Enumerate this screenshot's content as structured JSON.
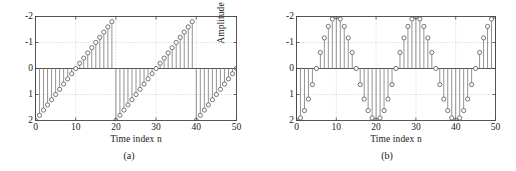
{
  "figure": {
    "panels": [
      {
        "caption": "(a)",
        "xlabel": "Time index n",
        "ylabel": "Amplitude",
        "xticks": [
          "0",
          "10",
          "20",
          "30",
          "40",
          "50"
        ],
        "yticks": [
          "2",
          "1",
          "0",
          "-1",
          "-2"
        ],
        "marker_color": "#555555",
        "stem_color": "#777777",
        "axis_color": "#444444",
        "grid_color": "#b0b0b0"
      },
      {
        "caption": "(b)",
        "xlabel": "Time index n",
        "ylabel": "Amplitude",
        "xticks": [
          "0",
          "10",
          "20",
          "30",
          "40",
          "50"
        ],
        "yticks": [
          "2",
          "1",
          "0",
          "-1",
          "-2"
        ],
        "marker_color": "#555555",
        "stem_color": "#777777",
        "axis_color": "#444444",
        "grid_color": "#b0b0b0"
      }
    ]
  },
  "chart_data": [
    {
      "type": "line",
      "title": "(a)",
      "subtitle": "",
      "plot_style": "stem",
      "xlabel": "Time index n",
      "ylabel": "Amplitude",
      "xlim": [
        0,
        50
      ],
      "ylim": [
        -2,
        2
      ],
      "xticks": [
        0,
        10,
        20,
        30,
        40,
        50
      ],
      "yticks": [
        -2,
        -1,
        0,
        1,
        2
      ],
      "grid": true,
      "legend": null,
      "description": "Sawtooth sequence of period 20, ramping from -2 up to 1.8 in steps of 0.2",
      "x": [
        0,
        1,
        2,
        3,
        4,
        5,
        6,
        7,
        8,
        9,
        10,
        11,
        12,
        13,
        14,
        15,
        16,
        17,
        18,
        19,
        20,
        21,
        22,
        23,
        24,
        25,
        26,
        27,
        28,
        29,
        30,
        31,
        32,
        33,
        34,
        35,
        36,
        37,
        38,
        39,
        40,
        41,
        42,
        43,
        44,
        45,
        46,
        47,
        48,
        49,
        50
      ],
      "values": [
        -2,
        -1.8,
        -1.6,
        -1.4,
        -1.2,
        -1,
        -0.8,
        -0.6,
        -0.4,
        -0.2,
        0,
        0.2,
        0.4,
        0.6,
        0.8,
        1,
        1.2,
        1.4,
        1.6,
        1.8,
        -2,
        -1.8,
        -1.6,
        -1.4,
        -1.2,
        -1,
        -0.8,
        -0.6,
        -0.4,
        -0.2,
        0,
        0.2,
        0.4,
        0.6,
        0.8,
        1,
        1.2,
        1.4,
        1.6,
        1.8,
        -2,
        -1.8,
        -1.6,
        -1.4,
        -1.2,
        -1,
        -0.8,
        -0.6,
        -0.4,
        -0.2,
        0
      ]
    },
    {
      "type": "line",
      "title": "(b)",
      "subtitle": "",
      "plot_style": "stem",
      "xlabel": "Time index n",
      "ylabel": "Amplitude",
      "xlim": [
        0,
        50
      ],
      "ylim": [
        -2,
        2
      ],
      "xticks": [
        0,
        10,
        20,
        30,
        40,
        50
      ],
      "yticks": [
        -2,
        -1,
        0,
        1,
        2
      ],
      "grid": true,
      "legend": null,
      "description": "Sinusoidal sequence 2*sin(2*pi*n/20 - pi/2), i.e. -2*cos(2*pi*n/20), period 20, amplitude 2",
      "x": [
        0,
        1,
        2,
        3,
        4,
        5,
        6,
        7,
        8,
        9,
        10,
        11,
        12,
        13,
        14,
        15,
        16,
        17,
        18,
        19,
        20,
        21,
        22,
        23,
        24,
        25,
        26,
        27,
        28,
        29,
        30,
        31,
        32,
        33,
        34,
        35,
        36,
        37,
        38,
        39,
        40,
        41,
        42,
        43,
        44,
        45,
        46,
        47,
        48,
        49,
        50
      ],
      "values": [
        -2,
        -1.902,
        -1.618,
        -1.176,
        -0.618,
        0,
        0.618,
        1.176,
        1.618,
        1.902,
        2,
        1.902,
        1.618,
        1.176,
        0.618,
        0,
        -0.618,
        -1.176,
        -1.618,
        -1.902,
        -2,
        -1.902,
        -1.618,
        -1.176,
        -0.618,
        0,
        0.618,
        1.176,
        1.618,
        1.902,
        2,
        1.902,
        1.618,
        1.176,
        0.618,
        0,
        -0.618,
        -1.176,
        -1.618,
        -1.902,
        -2,
        -1.902,
        -1.618,
        -1.176,
        -0.618,
        0,
        0.618,
        1.176,
        1.618,
        1.902,
        2
      ]
    }
  ]
}
